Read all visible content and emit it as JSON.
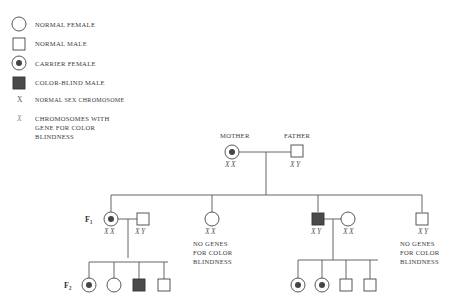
{
  "legend": {
    "items": [
      {
        "symbol": "normal-female",
        "label": "NORMAL FEMALE"
      },
      {
        "symbol": "normal-male",
        "label": "NORMAL MALE"
      },
      {
        "symbol": "carrier-female",
        "label": "CARRIER FEMALE"
      },
      {
        "symbol": "color-blind-male",
        "label": "COLOR-BLIND MALE"
      },
      {
        "symbol": "X",
        "label": "NORMAL SEX CHROMOSOME"
      },
      {
        "symbol": "X",
        "label_lines": [
          "CHROMOSOMES WITH",
          "GENE FOR COLOR",
          "BLINDNESS"
        ]
      }
    ]
  },
  "parents": {
    "mother": {
      "label": "MOTHER",
      "type": "carrier-female",
      "genotype": "XX"
    },
    "father": {
      "label": "FATHER",
      "type": "normal-male",
      "genotype": "XY"
    }
  },
  "generations": {
    "f1_label": "F₁",
    "f2_label": "F₂"
  },
  "f1": [
    {
      "type": "carrier-female",
      "genotype": "XX",
      "spouse": {
        "type": "normal-male",
        "genotype": "XY"
      }
    },
    {
      "type": "normal-female",
      "genotype": "XX",
      "note_lines": [
        "NO GENES",
        "FOR COLOR",
        "BLINDNESS"
      ]
    },
    {
      "type": "color-blind-male",
      "genotype": "XY",
      "spouse": {
        "type": "normal-female",
        "genotype": "XX"
      }
    },
    {
      "type": "normal-male",
      "genotype": "XY",
      "note_lines": [
        "NO GENES",
        "FOR COLOR",
        "BLINDNESS"
      ]
    }
  ],
  "f2": {
    "family_1": [
      "carrier-female",
      "normal-female",
      "color-blind-male",
      "normal-male"
    ],
    "family_2": [
      "carrier-female",
      "carrier-female",
      "normal-male",
      "normal-male"
    ]
  }
}
